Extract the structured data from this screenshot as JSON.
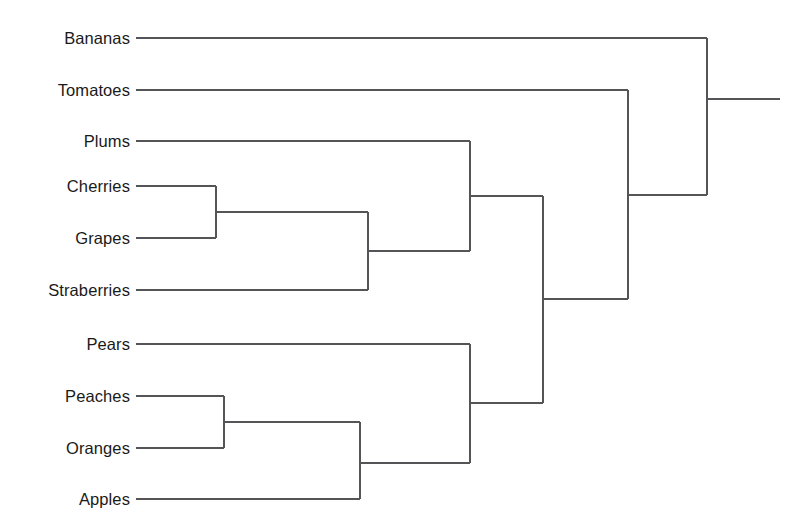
{
  "chart_data": {
    "type": "dendrogram",
    "title": "",
    "xlabel": "",
    "ylabel": "",
    "orientation": "horizontal-left-to-right",
    "grid": false,
    "legend": null,
    "axis_visible": false,
    "stroke_color": "#555558",
    "label_color": "#1a1a1a",
    "background_color": "#ffffff",
    "leaf_label_x": 130,
    "leaf_stub_x": 136,
    "root_end_x": 780,
    "leaves": [
      {
        "name": "Bananas",
        "y": 38,
        "stub_x": 136
      },
      {
        "name": "Tomatoes",
        "y": 90,
        "stub_x": 136
      },
      {
        "name": "Plums",
        "y": 141,
        "stub_x": 136
      },
      {
        "name": "Cherries",
        "y": 186,
        "stub_x": 136
      },
      {
        "name": "Grapes",
        "y": 238,
        "stub_x": 136
      },
      {
        "name": "Straberries",
        "y": 290,
        "stub_x": 136
      },
      {
        "name": "Pears",
        "y": 344,
        "stub_x": 136
      },
      {
        "name": "Peaches",
        "y": 396,
        "stub_x": 136
      },
      {
        "name": "Oranges",
        "y": 448,
        "stub_x": 136
      },
      {
        "name": "Apples",
        "y": 499,
        "stub_x": 136
      }
    ],
    "merges": [
      {
        "id": "m1",
        "label": "Cherries + Grapes",
        "x": 216,
        "y_top": 186,
        "y_bottom": 238,
        "y": 212
      },
      {
        "id": "m2",
        "label": "(Cherries,Grapes) + Straberries",
        "x": 368,
        "y_top": 212,
        "y_bottom": 290,
        "y": 251
      },
      {
        "id": "m3",
        "label": "Peaches + Oranges",
        "x": 224,
        "y_top": 396,
        "y_bottom": 448,
        "y": 422
      },
      {
        "id": "m4",
        "label": "(Peaches,Oranges) + Apples",
        "x": 360,
        "y_top": 422,
        "y_bottom": 499,
        "y": 463
      },
      {
        "id": "m5",
        "label": "Pears + (Peaches,Oranges,Apples)",
        "x": 470,
        "y_top": 344,
        "y_bottom": 463,
        "y": 403
      },
      {
        "id": "m6",
        "label": "Plums + (Cherries,Grapes,Straberries)",
        "x": 470,
        "y_top": 141,
        "y_bottom": 251,
        "y": 196
      },
      {
        "id": "m7",
        "label": "Plum-cluster + Pear-cluster",
        "x": 543,
        "y_top": 196,
        "y_bottom": 403,
        "y": 299
      },
      {
        "id": "m8",
        "label": "Tomatoes + big-cluster",
        "x": 628,
        "y_top": 90,
        "y_bottom": 299,
        "y": 195
      },
      {
        "id": "m9",
        "label": "Bananas + all",
        "x": 707,
        "y_top": 38,
        "y_bottom": 195,
        "y": 99
      }
    ]
  }
}
